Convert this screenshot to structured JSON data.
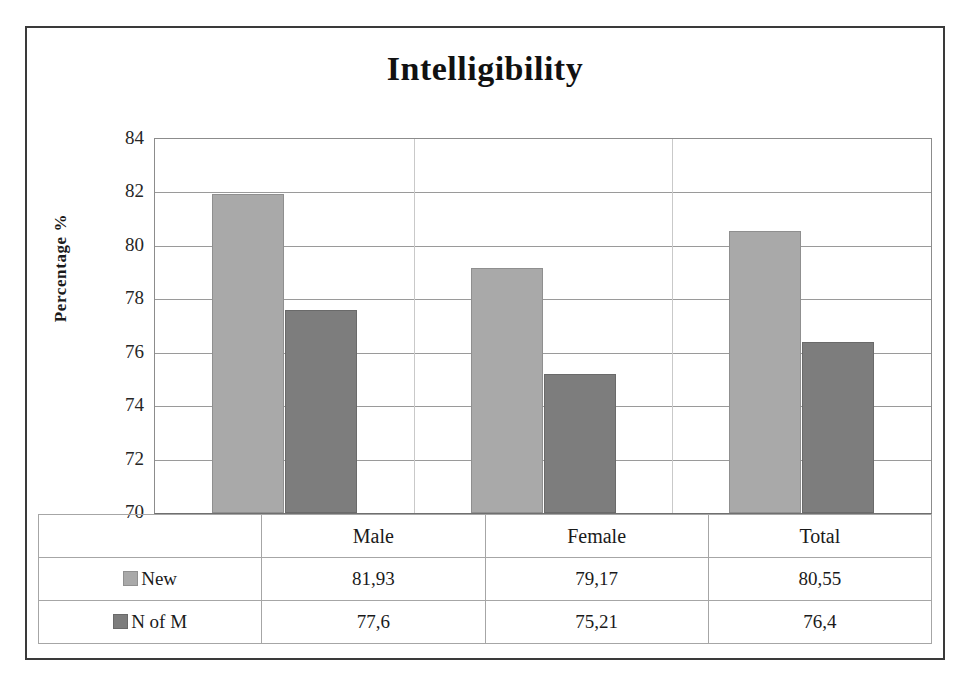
{
  "chart_data": {
    "type": "bar",
    "title": "Intelligibility",
    "xlabel": "",
    "ylabel": "Percentage %",
    "categories": [
      "Male",
      "Female",
      "Total"
    ],
    "series": [
      {
        "name": "New",
        "color": "#a9a9a9",
        "values": [
          81.93,
          79.17,
          80.55
        ],
        "labels": [
          "81,93",
          "79,17",
          "80,55"
        ]
      },
      {
        "name": "N of M",
        "color": "#7d7d7d",
        "values": [
          77.6,
          75.21,
          76.4
        ],
        "labels": [
          "77,6",
          "75,21",
          "76,4"
        ]
      }
    ],
    "ylim": [
      70,
      84
    ],
    "yticks": [
      84,
      82,
      80,
      78,
      76,
      74,
      72,
      70
    ],
    "ytick_labels": [
      "84",
      "82",
      "80",
      "78",
      "76",
      "74",
      "72",
      "70"
    ],
    "grid": true,
    "legend_position": "data-table-left",
    "data_table_visible": true
  }
}
